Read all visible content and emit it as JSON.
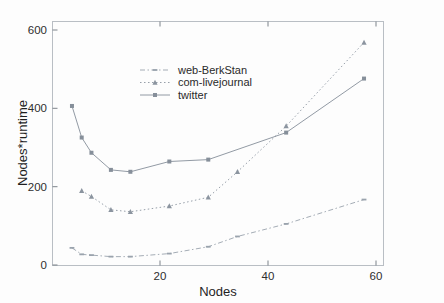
{
  "chart_data": {
    "type": "line",
    "title": "",
    "xlabel": "Nodes",
    "ylabel": "Nodes*runtime",
    "xlim": [
      0,
      68
    ],
    "ylim": [
      0,
      640
    ],
    "xticks": [
      20,
      40,
      60
    ],
    "yticks": [
      0,
      200,
      400,
      600
    ],
    "xtick_labels": [
      "20",
      "40",
      "60"
    ],
    "ytick_labels": [
      "0",
      "200",
      "400",
      "600"
    ],
    "grid": false,
    "legend_position": "upper-center-left",
    "series": [
      {
        "name": "web-BerkStan",
        "marker": "dash",
        "linestyle": "dashdot",
        "color": "#9aa3ad",
        "x": [
          4,
          6,
          8,
          12,
          16,
          24,
          32,
          38,
          48,
          64
        ],
        "values": [
          45,
          28,
          26,
          22,
          22,
          30,
          48,
          75,
          108,
          172
        ]
      },
      {
        "name": "com-livejournal",
        "marker": "triangle",
        "linestyle": "dotted",
        "color": "#8b949f",
        "x": [
          6,
          8,
          12,
          16,
          24,
          32,
          38,
          48,
          64
        ],
        "values": [
          195,
          180,
          145,
          140,
          155,
          178,
          245,
          365,
          585
        ]
      },
      {
        "name": "twitter",
        "marker": "square",
        "linestyle": "solid",
        "color": "#868f9a",
        "x": [
          4,
          6,
          8,
          12,
          16,
          24,
          32,
          48,
          64
        ],
        "values": [
          418,
          335,
          295,
          250,
          245,
          272,
          277,
          348,
          490
        ]
      }
    ]
  },
  "axes": {
    "x_title": "Nodes",
    "y_title": "Nodes*runtime"
  },
  "legend": {
    "entries": [
      {
        "label": "web-BerkStan"
      },
      {
        "label": "com-livejournal"
      },
      {
        "label": "twitter"
      }
    ]
  },
  "ticks": {
    "y": [
      "600",
      "400",
      "200",
      "0"
    ],
    "x": [
      "20",
      "40",
      "60"
    ]
  },
  "colors": {
    "line_web_berkstan": "#9aa3ad",
    "line_com_livejournal": "#8b949f",
    "line_twitter": "#868f9a",
    "axis": "#b9bec4",
    "text": "#2e2e2e",
    "background": "#fdfdfd"
  }
}
